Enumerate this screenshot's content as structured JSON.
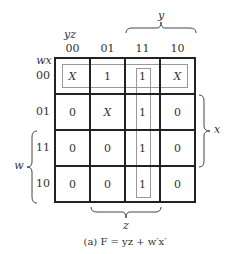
{
  "kmap": {
    "row_var_label": "wx",
    "col_var_label": "yz",
    "col_headers": [
      "00",
      "01",
      "11",
      "10"
    ],
    "row_headers": [
      "00",
      "01",
      "11",
      "10"
    ],
    "cells": [
      [
        "X",
        "1",
        "1",
        "X"
      ],
      [
        "0",
        "X",
        "1",
        "0"
      ],
      [
        "0",
        "0",
        "1",
        "0"
      ],
      [
        "0",
        "0",
        "1",
        "0"
      ]
    ],
    "brace_labels": {
      "y": "y",
      "x": "x",
      "w": "w",
      "z": "z"
    },
    "groups": [
      {
        "name": "w'x'",
        "description": "row 00 all four cells"
      },
      {
        "name": "yz",
        "description": "column 11 all four cells"
      }
    ]
  },
  "caption": "(a)  F = yz + w′x′"
}
